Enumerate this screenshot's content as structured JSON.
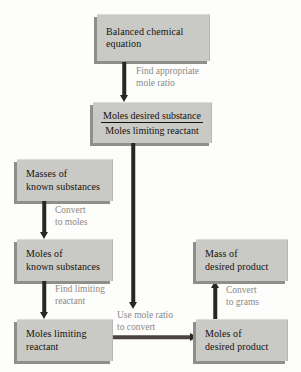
{
  "diagram": {
    "colors": {
      "box_fill": "#c9c9c5",
      "box_shadow": "#8e8e8a",
      "arrow": "#2a2622",
      "label_text": "#8a8a86",
      "box_text": "#16120f",
      "background": "#fdfdfc"
    },
    "boxes": {
      "balanced_equation": {
        "line1": "Balanced chemical",
        "line2": "equation"
      },
      "mole_ratio": {
        "numerator": "Moles desired substance",
        "denominator": "Moles limiting reactant"
      },
      "masses_known": {
        "line1": "Masses of",
        "line2": "known substances"
      },
      "moles_known": {
        "line1": "Moles of",
        "line2": "known substances"
      },
      "moles_limiting": {
        "line1": "Moles limiting",
        "line2": "reactant"
      },
      "moles_desired_product": {
        "line1": "Moles of",
        "line2": "desired product"
      },
      "mass_desired_product": {
        "line1": "Mass of",
        "line2": "desired product"
      }
    },
    "arrow_labels": {
      "find_mole_ratio": {
        "line1": "Find appropriate",
        "line2": "mole ratio"
      },
      "convert_to_moles": {
        "line1": "Convert",
        "line2": "to moles"
      },
      "find_limiting_reactant": {
        "line1": "Find limiting",
        "line2": "reactant"
      },
      "use_mole_ratio": {
        "line1": "Use mole ratio",
        "line2": "to convert"
      },
      "convert_to_grams": {
        "line1": "Convert",
        "line2": "to grams"
      }
    }
  }
}
